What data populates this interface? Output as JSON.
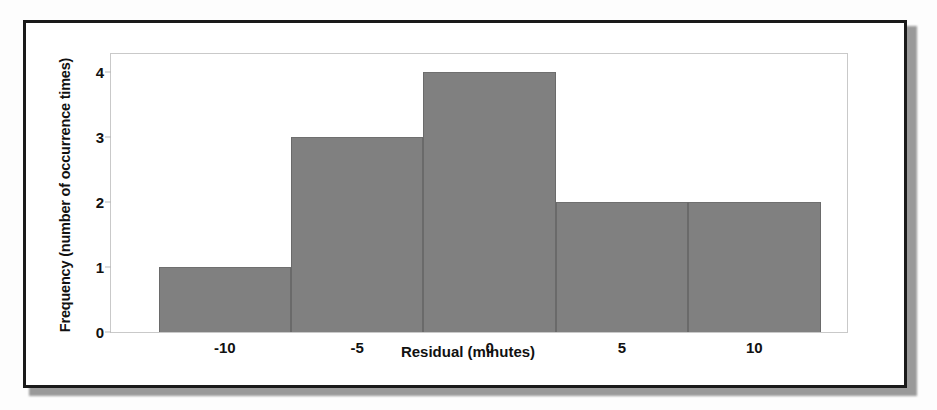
{
  "chart_data": {
    "type": "bar",
    "title": "",
    "xlabel": "Residual (minutes)",
    "ylabel": "Frequency (number of occurrence times)",
    "categories": [
      "-12.5 to -7.5",
      "-7.5 to -2.5",
      "-2.5 to 2.5",
      "2.5 to 7.5",
      "7.5 to 12.5"
    ],
    "bin_edges": [
      -12.5,
      -7.5,
      -2.5,
      2.5,
      7.5,
      12.5
    ],
    "bin_width": 5,
    "values": [
      1,
      3,
      4,
      2,
      2
    ],
    "xlim": [
      -14.3,
      13.5
    ],
    "ylim": [
      0,
      4.28
    ],
    "xticks": [
      -10,
      -5,
      0,
      5,
      10
    ],
    "xtick_labels": [
      "-10",
      "-5",
      "0",
      "5",
      "10"
    ],
    "yticks": [
      0,
      1,
      2,
      3,
      4
    ],
    "ytick_labels": [
      "0",
      "1",
      "2",
      "3",
      "4"
    ],
    "grid": false,
    "legend": false,
    "bar_color": "#808080",
    "bar_edge_color": "#6a6a6a",
    "axes_frame_color": "#c9c9c9",
    "text_color": "#111111",
    "figure_border_color": "#1a1a1a",
    "background_color": "#ffffff"
  }
}
